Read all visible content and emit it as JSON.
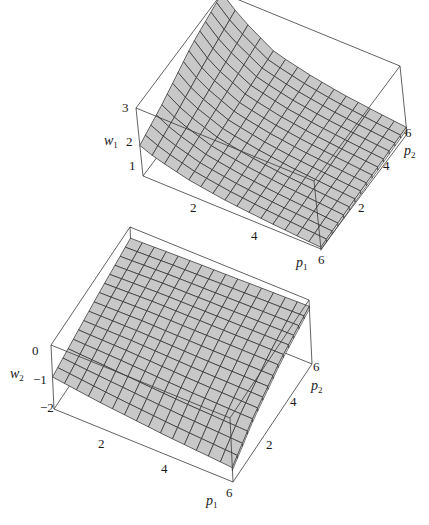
{
  "chart_data": [
    {
      "type": "surface3d",
      "title": "",
      "xlabel": "p1",
      "ylabel": "p2",
      "zlabel": "w1",
      "x_ticks": [
        "2",
        "4",
        "6"
      ],
      "y_ticks": [
        "2",
        "4",
        "6"
      ],
      "z_ticks": [
        "1",
        "2",
        "3"
      ],
      "xlim": [
        0.5,
        6
      ],
      "ylim": [
        0.5,
        6
      ],
      "zlim": [
        1,
        3
      ],
      "grid_lines": 15,
      "description": "Surface rises steeply toward low p1 / high p2 (peak ~3 near p1≈0.5, p2 high), decreasing toward ~1 at high p1",
      "surface_color": "#c8c8c8",
      "mesh_color": "#2a2a2a",
      "samples": {
        "p1": [
          0.5,
          1,
          2,
          3,
          4,
          5,
          6
        ],
        "p2": [
          0.5,
          2,
          4,
          6
        ],
        "w1": [
          [
            1.9,
            2.2,
            2.7,
            3.0
          ],
          [
            1.7,
            1.9,
            2.2,
            2.5
          ],
          [
            1.45,
            1.55,
            1.7,
            1.85
          ],
          [
            1.3,
            1.38,
            1.48,
            1.6
          ],
          [
            1.2,
            1.26,
            1.34,
            1.42
          ],
          [
            1.12,
            1.18,
            1.24,
            1.3
          ],
          [
            1.05,
            1.1,
            1.15,
            1.2
          ]
        ]
      }
    },
    {
      "type": "surface3d",
      "title": "",
      "xlabel": "p1",
      "ylabel": "p2",
      "zlabel": "w2",
      "x_ticks": [
        "2",
        "4",
        "6"
      ],
      "y_ticks": [
        "2",
        "4",
        "6"
      ],
      "z_ticks": [
        "0",
        "-1",
        "-2"
      ],
      "xlim": [
        0.5,
        6
      ],
      "ylim": [
        0.5,
        6
      ],
      "zlim": [
        -2,
        0
      ],
      "grid_lines": 15,
      "description": "Gently varying surface between about -1.6 and -0.2; highest at high p1/high p2 corner, lowest at low p1/low p2",
      "surface_color": "#c8c8c8",
      "mesh_color": "#2a2a2a",
      "samples": {
        "p1": [
          0.5,
          2,
          4,
          6
        ],
        "p2": [
          0.5,
          2,
          4,
          6
        ],
        "w2": [
          [
            -1.0,
            -0.8,
            -0.55,
            -0.35
          ],
          [
            -1.2,
            -0.85,
            -0.5,
            -0.3
          ],
          [
            -1.4,
            -0.95,
            -0.5,
            -0.25
          ],
          [
            -1.55,
            -1.0,
            -0.5,
            -0.2
          ]
        ]
      }
    }
  ],
  "plots": {
    "top": {
      "zlabel": "w",
      "zlabel_sub": "1",
      "xlabel": "p",
      "xlabel_sub": "1",
      "ylabel": "p",
      "ylabel_sub": "2",
      "z_ticks": [
        "3",
        "2",
        "1"
      ],
      "x_ticks": [
        "2",
        "4",
        "6"
      ],
      "y_ticks": [
        "6",
        "4",
        "2"
      ]
    },
    "bottom": {
      "zlabel": "w",
      "zlabel_sub": "2",
      "xlabel": "p",
      "xlabel_sub": "1",
      "ylabel": "p",
      "ylabel_sub": "2",
      "z_ticks": [
        "0",
        "−1",
        "−2"
      ],
      "x_ticks": [
        "2",
        "4",
        "6"
      ],
      "y_ticks": [
        "6",
        "4",
        "2"
      ]
    }
  }
}
